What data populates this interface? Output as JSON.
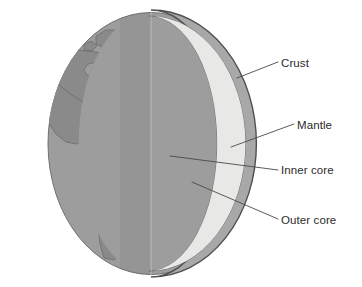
{
  "figure": {
    "background_color": "#ffffff"
  },
  "labels": [
    {
      "id": "crust",
      "text": "Crust",
      "color": "#2b2b2b"
    },
    {
      "id": "mantle",
      "text": "Mantle",
      "color": "#2b2b2b"
    },
    {
      "id": "inner_core",
      "text": "Inner core",
      "color": "#2b2b2b"
    },
    {
      "id": "outer_core",
      "text": "Outer core",
      "color": "#2b2b2b"
    }
  ],
  "leader_lines": {
    "stroke_color": "#4a4a4a",
    "stroke_width": 0.9
  },
  "layers": {
    "ocean": {
      "name": "ocean",
      "color": "#9d9d9d"
    },
    "land": {
      "name": "land",
      "color": "#8a8a8a"
    },
    "globe_shadow": {
      "name": "globe-shadow",
      "color": "#b5b5b5"
    },
    "crust_rim": {
      "name": "crust-rim",
      "color": "#a8a8a8"
    },
    "crust_rim_edge": {
      "name": "crust-rim-edge",
      "color": "#555555"
    },
    "mantle_light": {
      "name": "mantle-light",
      "color": "#e8e8e6"
    },
    "mantle_shade": {
      "name": "mantle-shade",
      "color": "#d8d8d6"
    },
    "outer_core_light": {
      "name": "outer-core-light",
      "color": "#c6c6c4"
    },
    "outer_core_shade": {
      "name": "outer-core-shade",
      "color": "#aeaeac"
    },
    "inner_core_light": {
      "name": "inner-core-light",
      "color": "#6e6e6e"
    },
    "inner_core_shade": {
      "name": "inner-core-shade",
      "color": "#3a3a3a"
    }
  }
}
